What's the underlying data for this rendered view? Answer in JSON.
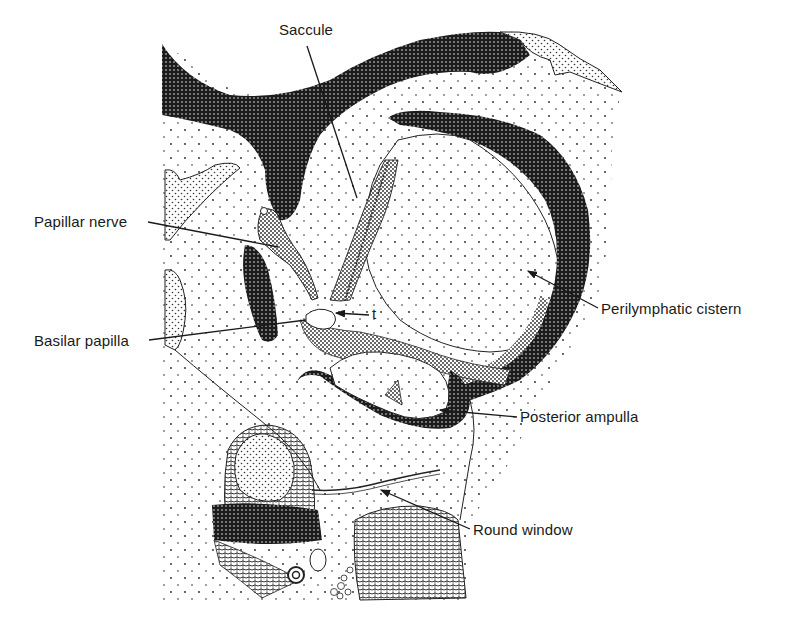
{
  "figure": {
    "type": "anatomical illustration (stippled line drawing)",
    "colors": {
      "ink": "#1a1a1a",
      "paper": "#ffffff",
      "dark_tissue": "#222222"
    }
  },
  "labels": [
    {
      "id": "saccule",
      "text": "Saccule",
      "x": 279,
      "y": 22
    },
    {
      "id": "papillar-nerve",
      "text": "Papillar nerve",
      "x": 34,
      "y": 214
    },
    {
      "id": "t",
      "text": "t",
      "x": 372,
      "y": 306
    },
    {
      "id": "basilar-papilla",
      "text": "Basilar papilla",
      "x": 34,
      "y": 335
    },
    {
      "id": "perilymphatic-cistern",
      "text": "Perilymphatic cistern",
      "x": 601,
      "y": 302
    },
    {
      "id": "posterior-ampulla",
      "text": "Posterior ampulla",
      "x": 520,
      "y": 408
    },
    {
      "id": "round-window",
      "text": "Round window",
      "x": 473,
      "y": 522
    }
  ]
}
